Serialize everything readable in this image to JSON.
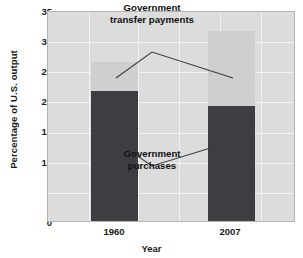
{
  "chart_data": {
    "type": "bar",
    "subtype": "stacked-bar",
    "title": "",
    "xlabel": "Year",
    "ylabel": "Percentage of U.S. output",
    "categories": [
      "1960",
      "2007"
    ],
    "series": [
      {
        "name": "Government purchases",
        "values": [
          21.8,
          19.2
        ],
        "color": "#3e3e42"
      },
      {
        "name": "Government transfer payments",
        "values": [
          4.9,
          12.6
        ],
        "color": "#cfcfcf"
      }
    ],
    "totals": [
      26.7,
      31.8
    ],
    "ylim": [
      0,
      35
    ],
    "yticks": [
      0,
      5,
      10,
      15,
      20,
      25,
      30,
      35
    ],
    "ytick_labels": [
      "0",
      "5",
      "10",
      "15",
      "20",
      "25",
      "30",
      "35"
    ],
    "grid": true,
    "legend": "annotations",
    "annotations": [
      {
        "id": "transfer",
        "text_line1": "Government",
        "text_line2": "transfer payments",
        "points_to": [
          "1960-upper",
          "2007-upper"
        ]
      },
      {
        "id": "purchases",
        "text_line1": "Government",
        "text_line2": "purchases",
        "points_to": [
          "1960-lower",
          "2007-lower"
        ]
      }
    ]
  },
  "axes": {
    "y_title": "Percentage of U.S. output",
    "x_title": "Year",
    "y_ticks": [
      "35",
      "30",
      "25",
      "20",
      "15",
      "10",
      "5",
      "0"
    ],
    "x_ticks": [
      "1960",
      "2007"
    ]
  },
  "annotations": {
    "transfer": {
      "line1": "Government",
      "line2": "transfer payments"
    },
    "purchases": {
      "line1": "Government",
      "line2": "purchases"
    }
  },
  "colors": {
    "purchases": "#3e3e42",
    "transfers": "#cfcfcf",
    "plot_background": "#dcdcdc",
    "gridline": "#f2f2f2",
    "text": "#1a1a1a",
    "leader_line": "#3d3d3d"
  }
}
